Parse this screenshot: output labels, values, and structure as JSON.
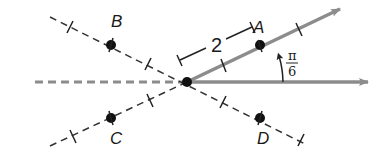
{
  "diagram": {
    "colors": {
      "ray": "#8c8c8c",
      "polar_axis": "#8c8c8c",
      "dashed": "#333333",
      "point": "#111111",
      "background": "#ffffff"
    },
    "pole": {
      "x": 187,
      "y": 82
    },
    "points": [
      {
        "label": "A",
        "x": 260,
        "y": 45
      },
      {
        "label": "B",
        "x": 111,
        "y": 45
      },
      {
        "label": "C",
        "x": 111,
        "y": 118
      },
      {
        "label": "D",
        "x": 260,
        "y": 118
      }
    ],
    "dimension_label": "2",
    "angle_label": {
      "numerator": "π",
      "denominator": "6"
    }
  }
}
